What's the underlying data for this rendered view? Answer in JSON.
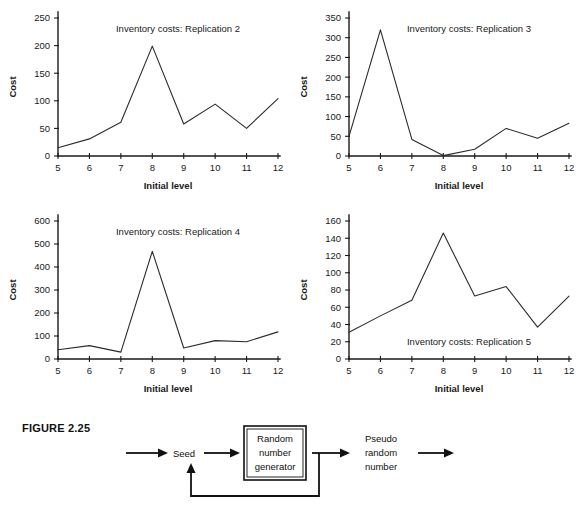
{
  "figure": {
    "label": "FIGURE 2.25",
    "diagram": {
      "input_arrow": "arrow-into-seed",
      "nodes": [
        {
          "id": "seed",
          "label": "Seed"
        },
        {
          "id": "rng",
          "label_line1": "Random",
          "label_line2": "number",
          "label_line3": "generator"
        },
        {
          "id": "output",
          "label_line1": "Pseudo",
          "label_line2": "random",
          "label_line3": "number"
        }
      ],
      "feedback_label": ""
    }
  },
  "chart_data": [
    {
      "type": "line",
      "title": "Inventory costs: Replication 2",
      "xlabel": "Initial level",
      "ylabel": "Cost",
      "x": [
        5,
        6,
        7,
        8,
        9,
        10,
        11,
        12
      ],
      "xticks": [
        "5",
        "6",
        "7",
        "8",
        "9",
        "10",
        "11",
        "12"
      ],
      "yticks": [
        "0",
        "50",
        "100",
        "150",
        "200",
        "250"
      ],
      "ytickvals": [
        0,
        50,
        100,
        150,
        200,
        250
      ],
      "values": [
        15,
        31,
        61,
        199,
        58,
        94,
        50,
        104
      ],
      "xlim": [
        5,
        12
      ],
      "ylim": [
        0,
        250
      ],
      "grid": false,
      "legend": "none",
      "title_position": "top-center"
    },
    {
      "type": "line",
      "title": "Inventory costs: Replication 3",
      "xlabel": "Initial level",
      "ylabel": "Cost",
      "x": [
        5,
        6,
        7,
        8,
        9,
        10,
        11,
        12
      ],
      "xticks": [
        "5",
        "6",
        "7",
        "8",
        "9",
        "10",
        "11",
        "12"
      ],
      "yticks": [
        "0",
        "50",
        "100",
        "150",
        "200",
        "250",
        "300",
        "350"
      ],
      "ytickvals": [
        0,
        50,
        100,
        150,
        200,
        250,
        300,
        350
      ],
      "values": [
        50,
        320,
        42,
        1,
        17,
        70,
        45,
        83
      ],
      "xlim": [
        5,
        12
      ],
      "ylim": [
        0,
        350
      ],
      "grid": false,
      "legend": "none",
      "title_position": "top-center"
    },
    {
      "type": "line",
      "title": "Inventory costs: Replication 4",
      "xlabel": "Initial level",
      "ylabel": "Cost",
      "x": [
        5,
        6,
        7,
        8,
        9,
        10,
        11,
        12
      ],
      "xticks": [
        "5",
        "6",
        "7",
        "8",
        "9",
        "10",
        "11",
        "12"
      ],
      "yticks": [
        "0",
        "100",
        "200",
        "300",
        "400",
        "500",
        "600"
      ],
      "ytickvals": [
        0,
        100,
        200,
        300,
        400,
        500,
        600
      ],
      "values": [
        40,
        58,
        30,
        468,
        48,
        80,
        75,
        118
      ],
      "xlim": [
        5,
        12
      ],
      "ylim": [
        0,
        600
      ],
      "grid": false,
      "legend": "none",
      "title_position": "top-center"
    },
    {
      "type": "line",
      "title": "Inventory costs: Replication 5",
      "xlabel": "Initial level",
      "ylabel": "Cost",
      "x": [
        5,
        6,
        7,
        8,
        9,
        10,
        11,
        12
      ],
      "xticks": [
        "5",
        "6",
        "7",
        "8",
        "9",
        "10",
        "11",
        "12"
      ],
      "yticks": [
        "0",
        "20",
        "40",
        "60",
        "80",
        "100",
        "120",
        "140",
        "160"
      ],
      "ytickvals": [
        0,
        20,
        40,
        60,
        80,
        100,
        120,
        140,
        160
      ],
      "values": [
        31,
        50,
        68,
        146,
        73,
        84,
        37,
        73
      ],
      "xlim": [
        5,
        12
      ],
      "ylim": [
        0,
        160
      ],
      "grid": false,
      "legend": "none",
      "title_position": "bottom-center"
    }
  ],
  "colors": {
    "line": "#2b2b2b",
    "axis": "#1a1a1a",
    "text": "#1a1a1a",
    "background": "#ffffff"
  }
}
